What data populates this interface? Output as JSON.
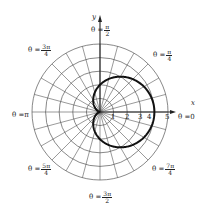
{
  "figure": {
    "type": "polar-graph",
    "curve": "r = 2 + 2cos(θ)",
    "colors": {
      "grid": "#555555",
      "curve": "#111111",
      "axis": "#222222",
      "background": "#ffffff"
    }
  },
  "axes": {
    "x_label": "x",
    "y_label": "y"
  },
  "radial_ticks": [
    "1",
    "2",
    "3",
    "4",
    "5"
  ],
  "angle_labels": {
    "theta0": {
      "prefix": "θ = ",
      "value": "0"
    },
    "theta_pi4": {
      "prefix": "θ = ",
      "num": "π",
      "den": "4"
    },
    "theta_pi2": {
      "prefix": "θ = ",
      "num": "π",
      "den": "2"
    },
    "theta_3pi4": {
      "prefix": "θ = ",
      "num": "3π",
      "den": "4"
    },
    "theta_pi": {
      "prefix": "θ = ",
      "value": "π"
    },
    "theta_5pi4": {
      "prefix": "θ = ",
      "num": "5π",
      "den": "4"
    },
    "theta_3pi2": {
      "prefix": "θ = ",
      "num": "3π",
      "den": "2"
    },
    "theta_7pi4": {
      "prefix": "θ = ",
      "num": "7π",
      "den": "4"
    }
  },
  "grid": {
    "circles": 5,
    "spoke_step_deg": 15
  }
}
